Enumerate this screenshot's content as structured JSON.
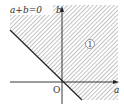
{
  "diagram": {
    "type": "coordinate-plane-region",
    "line_label": "a+b=0",
    "y_axis_label": "b",
    "x_axis_label": "a",
    "origin_label": "O",
    "region_label": "1",
    "colors": {
      "hatch": "#9a9a9a",
      "axis": "#222222",
      "line": "#222222",
      "background": "#ffffff"
    }
  }
}
